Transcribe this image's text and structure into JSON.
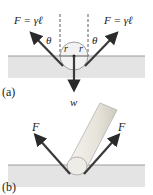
{
  "panel_a": {
    "label": "(a)",
    "force_left": "F = γℓ",
    "force_right": "F = γℓ",
    "angle_left": "θ",
    "angle_right": "θ",
    "radius_left": "r",
    "radius_right": "r",
    "weight": "w"
  },
  "panel_b": {
    "label": "(b)",
    "force_left": "F",
    "force_right": "F"
  },
  "colors": {
    "liquid": "#e4e4e4",
    "surface_line": "#9a9a9a",
    "arrow": "#3a3a3a",
    "sphere": "#f2f2f2",
    "leg": "#e8e6e0"
  }
}
